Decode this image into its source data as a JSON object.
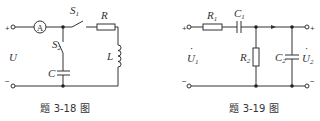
{
  "figures": [
    {
      "id": "fig-3-18",
      "caption": "题 3-18 图",
      "labels": {
        "ammeter": "A",
        "switch1": "S",
        "switch1_sub": "1",
        "switch2": "S",
        "switch2_sub": "2",
        "resistor": "R",
        "inductor": "L",
        "capacitor": "C",
        "voltage": "U",
        "plus": "+",
        "minus": "−"
      }
    },
    {
      "id": "fig-3-19",
      "caption": "题 3-19 图",
      "labels": {
        "r1": "R",
        "r1_sub": "1",
        "c1": "C",
        "c1_sub": "1",
        "r2": "R",
        "r2_sub": "2",
        "c2": "C",
        "c2_sub": "2",
        "u1": "U",
        "u1_sub": "1",
        "u2": "U",
        "u2_sub": "2",
        "phasor_dot": "·",
        "plus_in": "+",
        "minus_in": "−",
        "plus_out": "+",
        "minus_out": "−"
      }
    }
  ]
}
